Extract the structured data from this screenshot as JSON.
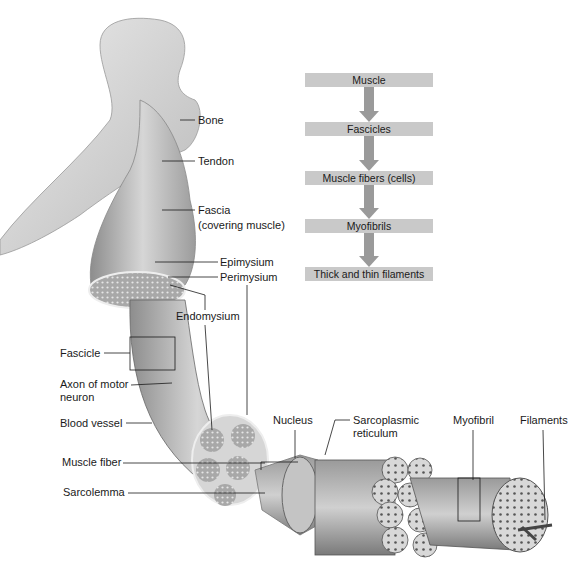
{
  "diagram": {
    "colors": {
      "flow_box": "#c9c9c9",
      "flow_arrow": "#9a9a9a",
      "label_text": "#1a1a1a",
      "leader_line": "#1a1a1a",
      "illustration": "grayscale"
    },
    "hierarchy_flow": [
      {
        "label": "Muscle"
      },
      {
        "label": "Fascicles"
      },
      {
        "label": "Muscle fibers (cells)"
      },
      {
        "label": "Myofibrils"
      },
      {
        "label": "Thick and thin filaments"
      }
    ],
    "labels": {
      "bone": "Bone",
      "tendon": "Tendon",
      "fascia_line1": "Fascia",
      "fascia_line2": "(covering muscle)",
      "epimysium": "Epimysium",
      "perimysium": "Perimysium",
      "endomysium": "Endomysium",
      "fascicle": "Fascicle",
      "axon_line1": "Axon of motor",
      "axon_line2": "neuron",
      "blood_vessel": "Blood vessel",
      "muscle_fiber": "Muscle fiber",
      "sarcolemma": "Sarcolemma",
      "nucleus": "Nucleus",
      "sr_line1": "Sarcoplasmic",
      "sr_line2": "reticulum",
      "myofibril": "Myofibril",
      "filaments": "Filaments"
    }
  }
}
